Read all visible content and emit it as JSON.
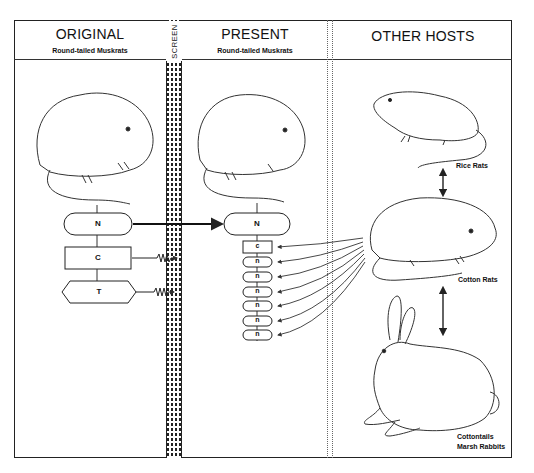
{
  "columns": {
    "original": {
      "title": "ORIGINAL",
      "subtitle": "Round-tailed Muskrats"
    },
    "screen": {
      "label": "SCREEN"
    },
    "present": {
      "title": "PRESENT",
      "subtitle": "Round-tailed Muskrats"
    },
    "other_hosts": {
      "title": "OTHER HOSTS"
    }
  },
  "original_nodes": [
    {
      "label": "N",
      "shape": "rounded"
    },
    {
      "label": "C",
      "shape": "rect"
    },
    {
      "label": "T",
      "shape": "hexagon"
    }
  ],
  "present_nodes": [
    {
      "label": "N",
      "shape": "rounded"
    },
    {
      "label": "c",
      "shape": "rect"
    },
    {
      "label": "n",
      "shape": "rounded"
    },
    {
      "label": "n",
      "shape": "rounded"
    },
    {
      "label": "n",
      "shape": "rounded"
    },
    {
      "label": "n",
      "shape": "rounded"
    },
    {
      "label": "n",
      "shape": "rounded"
    },
    {
      "label": "n",
      "shape": "rounded"
    }
  ],
  "hosts": [
    {
      "label": "Rice Rats"
    },
    {
      "label": "Cotton Rats"
    },
    {
      "label": "Cottontails"
    },
    {
      "label": "Marsh Rabbits"
    }
  ]
}
